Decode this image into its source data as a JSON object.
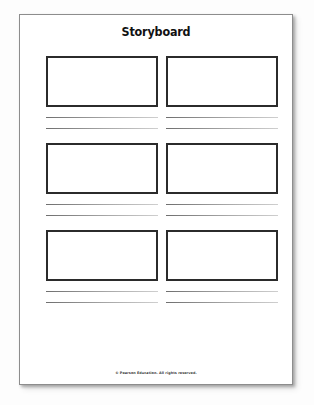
{
  "document": {
    "title": "Storyboard",
    "footer_copyright": "© Pearson Education. All rights reserved.",
    "page_background": "#ffffff",
    "border_color": "#8d8d8d",
    "frame_border_color": "#2b2b2b",
    "rule_color": "#a8a8a8",
    "title_color": "#111111"
  },
  "storyboard": {
    "rows": [
      {
        "row_label": "row-1",
        "cells": [
          {
            "cell_label": "panel-1",
            "frame_content": "",
            "lines": [
              "",
              ""
            ]
          },
          {
            "cell_label": "panel-2",
            "frame_content": "",
            "lines": [
              "",
              ""
            ]
          }
        ]
      },
      {
        "row_label": "row-2",
        "cells": [
          {
            "cell_label": "panel-3",
            "frame_content": "",
            "lines": [
              "",
              ""
            ]
          },
          {
            "cell_label": "panel-4",
            "frame_content": "",
            "lines": [
              "",
              ""
            ]
          }
        ]
      },
      {
        "row_label": "row-3",
        "cells": [
          {
            "cell_label": "panel-5",
            "frame_content": "",
            "lines": [
              "",
              ""
            ]
          },
          {
            "cell_label": "panel-6",
            "frame_content": "",
            "lines": [
              "",
              ""
            ]
          }
        ]
      }
    ]
  }
}
